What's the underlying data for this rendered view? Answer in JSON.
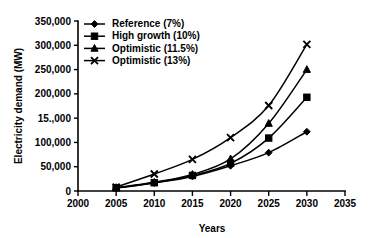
{
  "chart_data": {
    "type": "line",
    "title": "",
    "xlabel": "Years",
    "ylabel": "Electricity demand (MW)",
    "x": [
      2005,
      2010,
      2015,
      2020,
      2025,
      2030
    ],
    "xlim": [
      2000,
      2035
    ],
    "ylim": [
      0,
      350000
    ],
    "xticks": [
      "2000",
      "2005",
      "2010",
      "2015",
      "2020",
      "2025",
      "2030",
      "2035"
    ],
    "xtick_values": [
      2000,
      2005,
      2010,
      2015,
      2020,
      2025,
      2030,
      2035
    ],
    "yticks": [
      "0",
      "50,000",
      "100,000",
      "15.,000",
      "200,000",
      "250,000",
      "300,000",
      "350,000"
    ],
    "ytick_values": [
      0,
      50000,
      100000,
      150000,
      200000,
      250000,
      300000,
      350000
    ],
    "grid": false,
    "legend_position": "top-left",
    "series": [
      {
        "name": "Reference (7%)",
        "marker": "diamond",
        "values": [
          6000,
          16500,
          30000,
          52000,
          79000,
          122000
        ]
      },
      {
        "name": "High growth (10%)",
        "marker": "square",
        "values": [
          6500,
          17000,
          32000,
          57000,
          109000,
          193000
        ]
      },
      {
        "name": "Optimistic (11.5%)",
        "marker": "triangle",
        "values": [
          7000,
          18000,
          34000,
          66000,
          139000,
          250000
        ]
      },
      {
        "name": "Optimistic (13%)",
        "marker": "cross",
        "values": [
          8000,
          35000,
          65000,
          110000,
          176000,
          302000
        ]
      }
    ]
  }
}
